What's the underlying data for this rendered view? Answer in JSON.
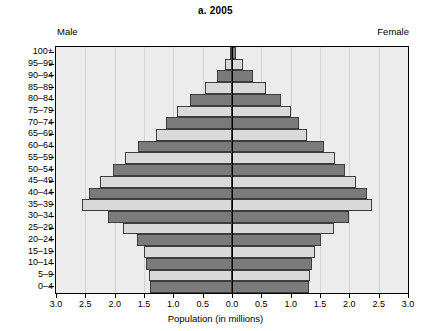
{
  "header": {
    "title": "a. 2005",
    "male_label": "Male",
    "female_label": "Female"
  },
  "axis": {
    "x_title": "Population (in millions)",
    "x_ticks": [
      "3.0",
      "2.5",
      "2.0",
      "1.5",
      "1.0",
      "0.5",
      "0.0",
      "0.5",
      "1.0",
      "1.5",
      "2.0",
      "2.5",
      "3.0"
    ]
  },
  "colors": {
    "bar_dark": "#7b7b7b",
    "bar_light": "#d9d9d9",
    "bar_outline": "#3d3d3d",
    "plot_background": "#ececec",
    "gridline": "#d3d3d3",
    "axis": "#000000"
  },
  "chart_data": {
    "type": "bar",
    "subtype": "population-pyramid",
    "title": "a. 2005",
    "xlabel": "Population (in millions)",
    "ylabel": "",
    "xlim": [
      -3.0,
      3.0
    ],
    "xtick_values": [
      -3.0,
      -2.5,
      -2.0,
      -1.5,
      -1.0,
      -0.5,
      0.0,
      0.5,
      1.0,
      1.5,
      2.0,
      2.5,
      3.0
    ],
    "xtick_labels": [
      "3.0",
      "2.5",
      "2.0",
      "1.5",
      "1.0",
      "0.5",
      "0.0",
      "0.5",
      "1.0",
      "1.5",
      "2.0",
      "2.5",
      "3.0"
    ],
    "grid": true,
    "legend": [
      "Male",
      "Female"
    ],
    "legend_position": "top-outside",
    "categories": [
      "0–4",
      "5–9",
      "10–14",
      "15–19",
      "20–24",
      "25–29",
      "30–34",
      "35–39",
      "40–44",
      "45–49",
      "50–54",
      "55–59",
      "60–64",
      "65–69",
      "70–74",
      "75–79",
      "80–84",
      "85–89",
      "90–94",
      "95–99",
      "100+"
    ],
    "series": [
      {
        "name": "Male",
        "side": "left",
        "values": [
          1.4,
          1.42,
          1.46,
          1.5,
          1.62,
          1.86,
          2.11,
          2.55,
          2.44,
          2.25,
          2.03,
          1.83,
          1.61,
          1.3,
          1.12,
          0.94,
          0.72,
          0.46,
          0.26,
          0.12,
          0.04
        ]
      },
      {
        "name": "Female",
        "side": "right",
        "values": [
          1.31,
          1.33,
          1.37,
          1.41,
          1.51,
          1.74,
          1.99,
          2.38,
          2.3,
          2.12,
          1.93,
          1.75,
          1.56,
          1.28,
          1.14,
          1.0,
          0.83,
          0.58,
          0.36,
          0.18,
          0.07
        ]
      }
    ],
    "shading": {
      "pattern": "alternating",
      "note": "Age bands alternate dark and light fill from the bottom band upward."
    }
  }
}
